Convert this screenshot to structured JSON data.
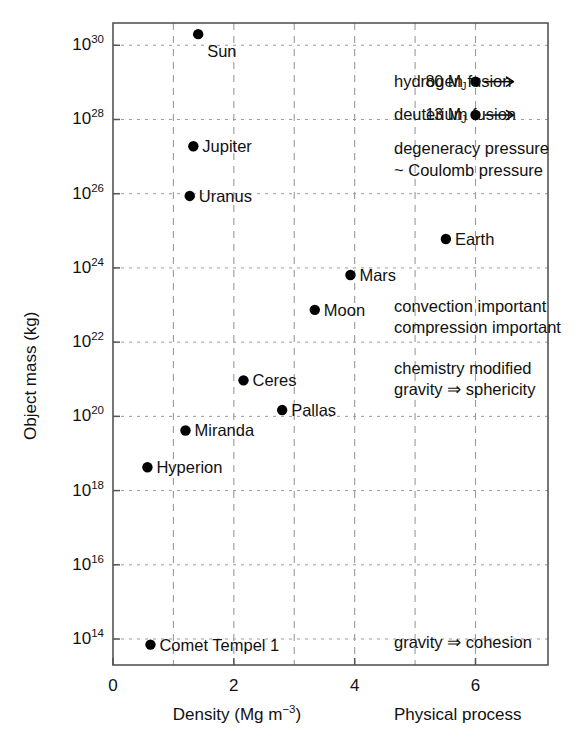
{
  "chart_data": {
    "type": "scatter",
    "title": "",
    "xlabel": "Density (Mg m−3)",
    "ylabel": "Object mass (kg)",
    "xlabel_secondary": "Physical process",
    "xlim": [
      0,
      7.2
    ],
    "ylim_log10": [
      13.3,
      30.6
    ],
    "yscale": "log",
    "grid": true,
    "xticks": [
      0,
      2,
      4,
      6
    ],
    "xticklabels": [
      "0",
      "2",
      "4",
      "6"
    ],
    "x_gridlines": [
      1,
      2,
      3,
      4,
      5,
      6
    ],
    "yticks_log10": [
      30,
      28,
      26,
      24,
      22,
      20,
      18,
      16,
      14
    ],
    "yticklabels": [
      "10",
      "10",
      "10",
      "10",
      "10",
      "10",
      "10",
      "10",
      "10"
    ],
    "ytick_exponents": [
      "30",
      "28",
      "26",
      "24",
      "22",
      "20",
      "18",
      "16",
      "14"
    ],
    "y_gridlines_log10": [
      30,
      28,
      26,
      24,
      22,
      20,
      18,
      16,
      14
    ],
    "legend": "none",
    "points": [
      {
        "label": "Sun",
        "density": 1.41,
        "mass_log10": 30.3,
        "label_side": "below-right"
      },
      {
        "label": "Jupiter",
        "density": 1.33,
        "mass_log10": 27.28,
        "label_side": "right"
      },
      {
        "label": "Uranus",
        "density": 1.27,
        "mass_log10": 25.94,
        "label_side": "right"
      },
      {
        "label": "Earth",
        "density": 5.51,
        "mass_log10": 24.78,
        "label_side": "right"
      },
      {
        "label": "Mars",
        "density": 3.93,
        "mass_log10": 23.81,
        "label_side": "right"
      },
      {
        "label": "Moon",
        "density": 3.34,
        "mass_log10": 22.87,
        "label_side": "right"
      },
      {
        "label": "Ceres",
        "density": 2.16,
        "mass_log10": 20.97,
        "label_side": "right"
      },
      {
        "label": "Pallas",
        "density": 2.8,
        "mass_log10": 20.17,
        "label_side": "right"
      },
      {
        "label": "Miranda",
        "density": 1.2,
        "mass_log10": 19.62,
        "label_side": "right"
      },
      {
        "label": "Hyperion",
        "density": 0.57,
        "mass_log10": 18.63,
        "label_side": "right"
      },
      {
        "label": "Comet Tempel 1",
        "density": 0.62,
        "mass_log10": 13.85,
        "label_side": "right"
      }
    ],
    "mass_limit_markers": [
      {
        "label": "80 M",
        "sub": "J",
        "density": 6.0,
        "mass_log10": 29.02,
        "arrow": "→",
        "process": "hydrogen fusion"
      },
      {
        "label": "13 M",
        "sub": "J",
        "density": 6.0,
        "mass_log10": 28.12,
        "arrow": "→",
        "process": "deuterium fusion"
      }
    ],
    "process_annotations": [
      {
        "text": "hydrogen fusion",
        "mass_log10": 29.02
      },
      {
        "text": "deuterium fusion",
        "mass_log10": 28.12
      },
      {
        "text": "degeneracy pressure",
        "mass_log10": 27.2
      },
      {
        "text": "~ Coulomb pressure",
        "mass_log10": 26.62
      },
      {
        "text": "convection important",
        "mass_log10": 22.95
      },
      {
        "text": "compression important",
        "mass_log10": 22.38
      },
      {
        "text": "chemistry modified",
        "mass_log10": 21.28
      },
      {
        "text": "gravity ⇒ sphericity",
        "mass_log10": 20.7
      },
      {
        "text": "gravity ⇒ cohesion",
        "mass_log10": 13.88
      }
    ]
  },
  "style": {
    "marker_color": "#000000",
    "axis_color": "#555555",
    "grid_color": "#9a9a9a",
    "text_color": "#111111",
    "background": "#ffffff",
    "marker_radius": 5.2
  }
}
